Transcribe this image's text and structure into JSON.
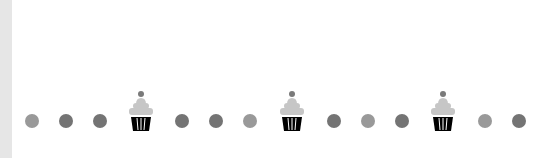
{
  "colors": {
    "background": "#ffffff",
    "left_strip": "#e6e6e6",
    "dot_light": "#999999",
    "dot_dark": "#747474",
    "frosting": "#c6c6c6",
    "cherry": "#7a7a7a",
    "wrapper": "#000000"
  },
  "row": {
    "items": [
      {
        "type": "dot",
        "x": 32,
        "shade": "light"
      },
      {
        "type": "dot",
        "x": 66,
        "shade": "dark"
      },
      {
        "type": "dot",
        "x": 100,
        "shade": "dark"
      },
      {
        "type": "cupcake",
        "x": 141
      },
      {
        "type": "dot",
        "x": 182,
        "shade": "dark"
      },
      {
        "type": "dot",
        "x": 216,
        "shade": "dark"
      },
      {
        "type": "dot",
        "x": 250,
        "shade": "light"
      },
      {
        "type": "cupcake",
        "x": 292
      },
      {
        "type": "dot",
        "x": 334,
        "shade": "dark"
      },
      {
        "type": "dot",
        "x": 368,
        "shade": "light"
      },
      {
        "type": "dot",
        "x": 402,
        "shade": "dark"
      },
      {
        "type": "cupcake",
        "x": 443
      },
      {
        "type": "dot",
        "x": 485,
        "shade": "light"
      },
      {
        "type": "dot",
        "x": 519,
        "shade": "dark"
      }
    ]
  }
}
